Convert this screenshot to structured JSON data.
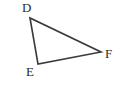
{
  "figure": {
    "kind": "geometry-diagram",
    "shape": "triangle",
    "name": "Triangle DEF",
    "canvas": {
      "width": 124,
      "height": 87
    },
    "background_color": "#ffffff",
    "stroke_color": "#3a3a3a",
    "stroke_width": 1.6,
    "label_color": "#2b2b2b"
  },
  "vertices": [
    {
      "id": "D",
      "label": "D",
      "x": 30,
      "y": 18,
      "label_x": 22,
      "label_y": 1
    },
    {
      "id": "E",
      "label": "E",
      "x": 38,
      "y": 64,
      "label_x": 26,
      "label_y": 65
    },
    {
      "id": "F",
      "label": "F",
      "x": 101,
      "y": 52,
      "label_x": 105,
      "label_y": 47
    }
  ],
  "edges": [
    {
      "id": "DE",
      "from": "D",
      "to": "E"
    },
    {
      "id": "EF",
      "from": "E",
      "to": "F"
    },
    {
      "id": "FD",
      "from": "F",
      "to": "D"
    }
  ],
  "polygon_points": "30,18 38,64 101,52"
}
